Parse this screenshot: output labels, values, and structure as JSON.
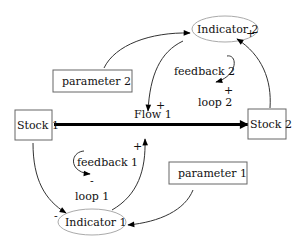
{
  "diagram": {
    "type": "stock-and-flow causal loop diagram",
    "stocks": [
      {
        "id": "stock1",
        "label": "Stock 1"
      },
      {
        "id": "stock2",
        "label": "Stock 2"
      }
    ],
    "flows": [
      {
        "id": "flow1",
        "label": "Flow 1",
        "from": "stock1",
        "to": "stock2"
      }
    ],
    "indicators": [
      {
        "id": "indicator1",
        "label": "Indicator 1"
      },
      {
        "id": "indicator2",
        "label": "Indicator 2"
      }
    ],
    "parameters": [
      {
        "id": "parameter1",
        "label": "parameter 1"
      },
      {
        "id": "parameter2",
        "label": "parameter 2"
      }
    ],
    "loops": [
      {
        "id": "loop1",
        "feedback_label": "feedback 1",
        "loop_label": "loop 1",
        "polarity": "-"
      },
      {
        "id": "loop2",
        "feedback_label": "feedback 2",
        "loop_label": "loop 2",
        "polarity": "+"
      }
    ],
    "links": [
      {
        "from": "stock1",
        "to": "indicator1",
        "polarity": "-"
      },
      {
        "from": "indicator1",
        "to": "flow1",
        "polarity": "+"
      },
      {
        "from": "parameter1",
        "to": "indicator1",
        "polarity": ""
      },
      {
        "from": "stock2",
        "to": "indicator2",
        "polarity": "+"
      },
      {
        "from": "indicator2",
        "to": "flow1",
        "polarity": "+"
      },
      {
        "from": "parameter2",
        "to": "indicator2",
        "polarity": ""
      }
    ],
    "signs": {
      "plus": "+",
      "minus": "-"
    }
  }
}
